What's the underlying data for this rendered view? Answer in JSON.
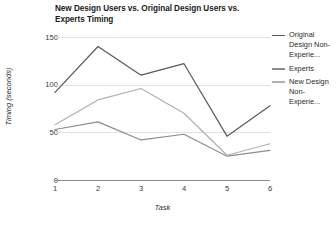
{
  "chart_data": {
    "type": "line",
    "title": "New Design Users vs. Original Design Users vs. Experts Timing",
    "xlabel": "Task",
    "ylabel": "Timing (seconds)",
    "categories": [
      "1",
      "2",
      "3",
      "4",
      "5",
      "6"
    ],
    "x": [
      1,
      2,
      3,
      4,
      5,
      6
    ],
    "ylim": [
      0,
      150
    ],
    "xlim": [
      1,
      6
    ],
    "yticks": [
      0,
      50,
      100,
      150
    ],
    "ytick_labels": [
      "0",
      "50",
      "100",
      "150"
    ],
    "xtick_labels": [
      "1",
      "2",
      "3",
      "4",
      "5",
      "6"
    ],
    "grid": true,
    "legend_position": "right",
    "series": [
      {
        "name": "Original Design Non-Experie...",
        "full_name": "Original Design Non-Experienced",
        "color": "#595959",
        "values": [
          92,
          140,
          110,
          122,
          46,
          78
        ]
      },
      {
        "name": "Experts",
        "full_name": "Experts",
        "color": "#8c8c8c",
        "values": [
          53,
          61,
          42,
          48,
          25,
          31
        ]
      },
      {
        "name": "New Design Non-Experie...",
        "full_name": "New Design Non-Experienced",
        "color": "#b0b0b0",
        "values": [
          58,
          84,
          96,
          70,
          26,
          38
        ]
      }
    ]
  },
  "colors": {
    "gridline": "#e2e2e2",
    "axis": "#8a8a8a",
    "text": "#2a2a2a",
    "background": "#ffffff"
  }
}
